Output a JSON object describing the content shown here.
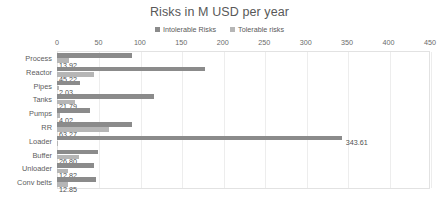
{
  "chart_data": {
    "type": "bar",
    "orientation": "horizontal",
    "title": "Risks in M USD per year",
    "xlabel": "",
    "ylabel": "",
    "xlim": [
      0,
      450
    ],
    "xticks": [
      0,
      50,
      100,
      150,
      200,
      250,
      300,
      350,
      400,
      450
    ],
    "grid": true,
    "legend_position": "top-center",
    "categories": [
      "Process",
      "Reactor",
      "Pipes",
      "Tanks",
      "Pumps",
      "RR",
      "Loader",
      "Buffer",
      "Unloader",
      "Conv belts"
    ],
    "series": [
      {
        "name": "Intolerable Risks",
        "color": "#8b8b8b",
        "values": [
          90.5,
          179.0,
          28.0,
          117.0,
          39.5,
          91.0,
          343.61,
          50.0,
          45.0,
          47.0
        ],
        "labels": [
          "",
          "",
          "",
          "",
          "",
          "",
          "343.61",
          "",
          "",
          ""
        ]
      },
      {
        "name": "Tolerable risks",
        "color": "#b6b6b6",
        "values": [
          13.92,
          45.22,
          2.03,
          21.79,
          4.02,
          63.27,
          1.2,
          26.8,
          12.82,
          12.85
        ],
        "labels": [
          "13.92",
          "45.22",
          "2.03",
          "21.79",
          "4.02",
          "63.27",
          "",
          "26.80",
          "12.82",
          "12.85"
        ]
      }
    ]
  },
  "legend": {
    "entries": [
      {
        "label": "Intolerable Risks",
        "color": "#8b8b8b"
      },
      {
        "label": "Tolerable risks",
        "color": "#b6b6b6"
      }
    ]
  },
  "colors": {
    "intolerable": "#8b8b8b",
    "tolerable": "#b6b6b6",
    "gridline": "#ededed",
    "plot_border": "#e2e2e2",
    "text": "#5a5a5a"
  }
}
